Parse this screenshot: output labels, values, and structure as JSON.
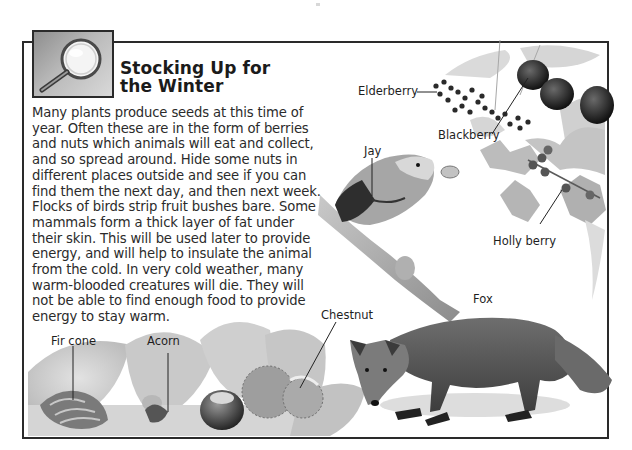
{
  "page": {
    "title_line1": "Stocking Up for",
    "title_line2": "the Winter",
    "icon": "magnifying-glass-icon",
    "body_lines": [
      "Many plants produce seeds at this time of",
      "year. Often these are in the form of berries",
      "and nuts which animals will eat and collect,",
      "and so spread around. Hide some nuts in",
      "different places outside and see if you can",
      "find them the next day, and then next week.",
      "Flocks of birds strip fruit bushes bare. Some",
      "mammals form a thick layer of fat under",
      "their skin. This will be used later to provide",
      "energy, and will help to insulate the animal",
      "from the cold. In very cold weather, many",
      "warm-blooded creatures will die. They will",
      "not be able to find enough food to provide",
      "energy to stay warm."
    ]
  },
  "illustration": {
    "labels": {
      "elderberry": "Elderberry",
      "blackberry": "Blackberry",
      "jay": "Jay",
      "holly_berry": "Holly berry",
      "fox": "Fox",
      "chestnut": "Chestnut",
      "fir_cone": "Fir cone",
      "acorn": "Acorn"
    }
  },
  "colors": {
    "frame": "#2a2a2a",
    "text": "#2b2b2b",
    "background": "#ffffff"
  }
}
